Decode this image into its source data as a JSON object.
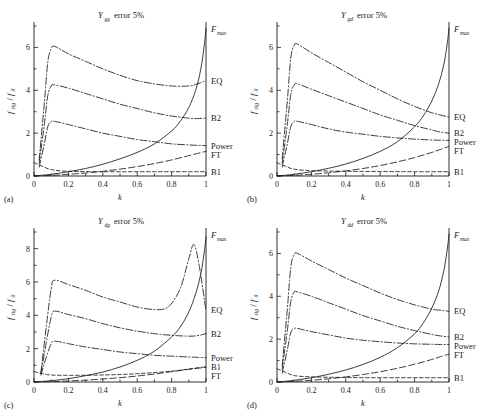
{
  "figure": {
    "panels": [
      {
        "id": "(a)",
        "title_var": "Y",
        "title_sub": "gg",
        "title_rest": "error 5%",
        "xlabel": "k",
        "ylabel_num": "f",
        "ylabel_num_sub": "sig",
        "ylabel_den": "f",
        "ylabel_den_sub": "0",
        "xticks": [
          "0",
          "0.2",
          "0.4",
          "0.6",
          "0.8",
          "1"
        ],
        "yticks": [
          "0",
          "2",
          "4",
          "6"
        ],
        "ylim": [
          0,
          7
        ],
        "xlim": [
          0,
          1
        ],
        "curve_labels": [
          "F",
          "EQ",
          "B2",
          "Power",
          "FT",
          "B1"
        ],
        "fmax_sub": "max"
      },
      {
        "id": "(b)",
        "title_var": "Y",
        "title_sub": "gd",
        "title_rest": "error 5%",
        "xlabel": "k",
        "ylabel_num": "f",
        "ylabel_num_sub": "sig",
        "ylabel_den": "f",
        "ylabel_den_sub": "0",
        "xticks": [
          "0",
          "0.2",
          "0.4",
          "0.6",
          "0.8",
          "1"
        ],
        "yticks": [
          "0",
          "2",
          "4",
          "6"
        ],
        "ylim": [
          0,
          7
        ],
        "xlim": [
          0,
          1
        ],
        "curve_labels": [
          "F",
          "EQ",
          "B2",
          "Power",
          "FT",
          "B1"
        ],
        "fmax_sub": "max"
      },
      {
        "id": "(c)",
        "title_var": "Y",
        "title_sub": "dg",
        "title_rest": "error 5%",
        "xlabel": "k",
        "ylabel_num": "f",
        "ylabel_num_sub": "sig",
        "ylabel_den": "f",
        "ylabel_den_sub": "0",
        "xticks": [
          "0",
          "0.2",
          "0.4",
          "0.6",
          "0.8",
          "1"
        ],
        "yticks": [
          "0",
          "2",
          "4",
          "6",
          "8"
        ],
        "ylim": [
          0,
          9
        ],
        "xlim": [
          0,
          1
        ],
        "curve_labels": [
          "F",
          "EQ",
          "B2",
          "Power",
          "B1",
          "FT"
        ],
        "fmax_sub": "max"
      },
      {
        "id": "(d)",
        "title_var": "Y",
        "title_sub": "dd",
        "title_rest": "error 5%",
        "xlabel": "k",
        "ylabel_num": "f",
        "ylabel_num_sub": "sig",
        "ylabel_den": "f",
        "ylabel_den_sub": "0",
        "xticks": [
          "0",
          "0.2",
          "0.4",
          "0.6",
          "0.8",
          "1"
        ],
        "yticks": [
          "0",
          "2",
          "4",
          "6"
        ],
        "ylim": [
          0,
          7
        ],
        "xlim": [
          0,
          1
        ],
        "curve_labels": [
          "F",
          "EQ",
          "B2",
          "Power",
          "FT",
          "B1"
        ],
        "fmax_sub": "max"
      }
    ]
  },
  "chart_data": [
    {
      "type": "line",
      "panel": "(a)",
      "title": "Y_gg error 5%",
      "xlabel": "k",
      "ylabel": "f_sig/f_0",
      "xlim": [
        0,
        1
      ],
      "ylim": [
        0,
        7
      ],
      "xticks": [
        0,
        0.2,
        0.4,
        0.6,
        0.8,
        1
      ],
      "yticks": [
        0,
        2,
        4,
        6
      ],
      "grid": false,
      "legend_position": "right-outside",
      "series": [
        {
          "name": "EQ",
          "style": "dash-dot",
          "x": [
            0.03,
            0.06,
            0.08,
            0.1,
            0.12,
            0.2,
            0.3,
            0.4,
            0.5,
            0.6,
            0.7,
            0.8,
            0.9,
            0.95,
            1.0
          ],
          "values": [
            0.75,
            3.4,
            5.3,
            5.95,
            6.05,
            5.7,
            5.35,
            5.0,
            4.7,
            4.45,
            4.3,
            4.2,
            4.2,
            4.3,
            4.45
          ]
        },
        {
          "name": "B2",
          "style": "dash-dot",
          "x": [
            0.03,
            0.06,
            0.08,
            0.1,
            0.12,
            0.2,
            0.3,
            0.4,
            0.5,
            0.6,
            0.7,
            0.8,
            0.9,
            0.95,
            1.0
          ],
          "values": [
            0.6,
            2.4,
            3.75,
            4.2,
            4.25,
            4.1,
            3.85,
            3.6,
            3.35,
            3.15,
            2.95,
            2.8,
            2.7,
            2.68,
            2.7
          ]
        },
        {
          "name": "Power",
          "style": "dash-dot",
          "x": [
            0.03,
            0.06,
            0.08,
            0.1,
            0.12,
            0.2,
            0.3,
            0.4,
            0.5,
            0.6,
            0.7,
            0.8,
            0.9,
            0.95,
            1.0
          ],
          "values": [
            0.42,
            1.5,
            2.3,
            2.55,
            2.55,
            2.4,
            2.2,
            2.0,
            1.85,
            1.7,
            1.6,
            1.5,
            1.45,
            1.43,
            1.42
          ]
        },
        {
          "name": "F_max",
          "style": "solid",
          "x": [
            0.0,
            0.1,
            0.2,
            0.3,
            0.4,
            0.5,
            0.6,
            0.7,
            0.8,
            0.85,
            0.9,
            0.94,
            0.97,
            0.99,
            1.0
          ],
          "values": [
            0.0,
            0.08,
            0.2,
            0.35,
            0.55,
            0.8,
            1.1,
            1.5,
            2.1,
            2.55,
            3.2,
            4.0,
            5.0,
            6.1,
            6.9
          ]
        },
        {
          "name": "FT",
          "style": "dashed-lg",
          "x": [
            0.0,
            0.1,
            0.2,
            0.3,
            0.4,
            0.5,
            0.6,
            0.7,
            0.8,
            0.9,
            0.95,
            1.0
          ],
          "values": [
            0.0,
            0.03,
            0.08,
            0.14,
            0.22,
            0.32,
            0.44,
            0.58,
            0.75,
            0.95,
            1.05,
            1.15
          ]
        },
        {
          "name": "B1",
          "style": "dashed",
          "x": [
            0.0,
            0.05,
            0.1,
            0.2,
            0.4,
            0.6,
            0.8,
            1.0
          ],
          "values": [
            0.62,
            0.45,
            0.3,
            0.22,
            0.2,
            0.2,
            0.2,
            0.2
          ]
        }
      ]
    },
    {
      "type": "line",
      "panel": "(b)",
      "title": "Y_gd error 5%",
      "xlabel": "k",
      "ylabel": "f_sig/f_0",
      "xlim": [
        0,
        1
      ],
      "ylim": [
        0,
        7
      ],
      "xticks": [
        0,
        0.2,
        0.4,
        0.6,
        0.8,
        1
      ],
      "yticks": [
        0,
        2,
        4,
        6
      ],
      "grid": false,
      "legend_position": "right-outside",
      "series": [
        {
          "name": "EQ",
          "style": "dash-dot",
          "x": [
            0.03,
            0.06,
            0.08,
            0.1,
            0.12,
            0.2,
            0.3,
            0.4,
            0.5,
            0.6,
            0.7,
            0.8,
            0.9,
            0.95,
            1.0
          ],
          "values": [
            0.8,
            3.5,
            5.5,
            6.1,
            6.15,
            5.75,
            5.3,
            4.85,
            4.4,
            4.0,
            3.6,
            3.25,
            2.95,
            2.85,
            2.75
          ]
        },
        {
          "name": "B2",
          "style": "dash-dot",
          "x": [
            0.03,
            0.06,
            0.08,
            0.1,
            0.12,
            0.2,
            0.3,
            0.4,
            0.5,
            0.6,
            0.7,
            0.8,
            0.9,
            0.95,
            1.0
          ],
          "values": [
            0.6,
            2.4,
            3.8,
            4.25,
            4.3,
            4.05,
            3.75,
            3.45,
            3.15,
            2.85,
            2.6,
            2.35,
            2.15,
            2.05,
            2.0
          ]
        },
        {
          "name": "Power",
          "style": "dash-dot",
          "x": [
            0.03,
            0.06,
            0.08,
            0.1,
            0.12,
            0.2,
            0.3,
            0.4,
            0.5,
            0.6,
            0.7,
            0.8,
            0.9,
            0.95,
            1.0
          ],
          "values": [
            0.42,
            1.5,
            2.3,
            2.55,
            2.55,
            2.4,
            2.2,
            2.05,
            1.95,
            1.85,
            1.78,
            1.72,
            1.68,
            1.67,
            1.66
          ]
        },
        {
          "name": "F_max",
          "style": "solid",
          "x": [
            0.0,
            0.1,
            0.2,
            0.3,
            0.4,
            0.5,
            0.6,
            0.7,
            0.8,
            0.85,
            0.9,
            0.94,
            0.97,
            0.99,
            1.0
          ],
          "values": [
            0.0,
            0.08,
            0.2,
            0.36,
            0.56,
            0.82,
            1.15,
            1.6,
            2.3,
            2.8,
            3.5,
            4.3,
            5.2,
            6.2,
            6.9
          ]
        },
        {
          "name": "FT",
          "style": "dashed-lg",
          "x": [
            0.0,
            0.1,
            0.2,
            0.3,
            0.4,
            0.5,
            0.6,
            0.7,
            0.8,
            0.9,
            0.95,
            1.0
          ],
          "values": [
            0.0,
            0.03,
            0.08,
            0.15,
            0.24,
            0.35,
            0.49,
            0.66,
            0.86,
            1.1,
            1.24,
            1.38
          ]
        },
        {
          "name": "B1",
          "style": "dashed",
          "x": [
            0.0,
            0.05,
            0.1,
            0.2,
            0.4,
            0.6,
            0.8,
            1.0
          ],
          "values": [
            0.62,
            0.45,
            0.32,
            0.25,
            0.22,
            0.21,
            0.2,
            0.2
          ]
        }
      ]
    },
    {
      "type": "line",
      "panel": "(c)",
      "title": "Y_dg error 5%",
      "xlabel": "k",
      "ylabel": "f_sig/f_0",
      "xlim": [
        0,
        1
      ],
      "ylim": [
        0,
        9
      ],
      "xticks": [
        0,
        0.2,
        0.4,
        0.6,
        0.8,
        1
      ],
      "yticks": [
        0,
        2,
        4,
        6,
        8
      ],
      "grid": false,
      "legend_position": "right-outside",
      "series": [
        {
          "name": "EQ",
          "style": "dash-dot",
          "x": [
            0.04,
            0.07,
            0.1,
            0.12,
            0.2,
            0.3,
            0.4,
            0.5,
            0.6,
            0.7,
            0.78,
            0.85,
            0.9,
            0.93,
            0.96,
            1.0
          ],
          "values": [
            0.55,
            3.2,
            5.6,
            6.1,
            5.85,
            5.5,
            5.1,
            4.8,
            4.5,
            4.35,
            4.5,
            5.6,
            7.4,
            8.25,
            7.0,
            4.3
          ]
        },
        {
          "name": "B2",
          "style": "dash-dot",
          "x": [
            0.04,
            0.07,
            0.1,
            0.12,
            0.2,
            0.3,
            0.4,
            0.5,
            0.6,
            0.7,
            0.8,
            0.9,
            0.95,
            1.0
          ],
          "values": [
            0.5,
            2.3,
            3.9,
            4.25,
            4.05,
            3.8,
            3.5,
            3.25,
            3.05,
            2.9,
            2.8,
            2.75,
            2.78,
            2.9
          ]
        },
        {
          "name": "Power",
          "style": "dash-dot",
          "x": [
            0.04,
            0.07,
            0.1,
            0.12,
            0.2,
            0.3,
            0.4,
            0.5,
            0.6,
            0.7,
            0.8,
            0.9,
            0.95,
            1.0
          ],
          "values": [
            0.42,
            1.45,
            2.3,
            2.45,
            2.3,
            2.1,
            1.95,
            1.8,
            1.7,
            1.6,
            1.55,
            1.5,
            1.48,
            1.46
          ]
        },
        {
          "name": "F_max",
          "style": "solid",
          "x": [
            0.0,
            0.1,
            0.2,
            0.3,
            0.4,
            0.5,
            0.6,
            0.7,
            0.8,
            0.85,
            0.9,
            0.94,
            0.97,
            0.99,
            1.0
          ],
          "values": [
            0.0,
            0.08,
            0.2,
            0.38,
            0.6,
            0.9,
            1.3,
            1.85,
            2.7,
            3.3,
            4.2,
            5.3,
            6.5,
            7.8,
            8.7
          ]
        },
        {
          "name": "B1",
          "style": "dashed",
          "x": [
            0.0,
            0.05,
            0.1,
            0.2,
            0.4,
            0.6,
            0.8,
            0.9,
            1.0
          ],
          "values": [
            0.62,
            0.5,
            0.42,
            0.4,
            0.42,
            0.5,
            0.65,
            0.78,
            0.92
          ]
        },
        {
          "name": "FT",
          "style": "dashed-lg",
          "x": [
            0.0,
            0.1,
            0.2,
            0.3,
            0.4,
            0.5,
            0.6,
            0.7,
            0.8,
            0.9,
            0.95,
            1.0
          ],
          "values": [
            0.0,
            0.02,
            0.06,
            0.11,
            0.18,
            0.26,
            0.36,
            0.48,
            0.62,
            0.76,
            0.82,
            0.88
          ]
        }
      ]
    },
    {
      "type": "line",
      "panel": "(d)",
      "title": "Y_dd error 5%",
      "xlabel": "k",
      "ylabel": "f_sig/f_0",
      "xlim": [
        0,
        1
      ],
      "ylim": [
        0,
        7
      ],
      "xticks": [
        0,
        0.2,
        0.4,
        0.6,
        0.8,
        1
      ],
      "yticks": [
        0,
        2,
        4,
        6
      ],
      "grid": false,
      "legend_position": "right-outside",
      "series": [
        {
          "name": "EQ",
          "style": "dash-dot",
          "x": [
            0.03,
            0.06,
            0.08,
            0.1,
            0.12,
            0.2,
            0.3,
            0.4,
            0.5,
            0.6,
            0.7,
            0.8,
            0.9,
            0.95,
            1.0
          ],
          "values": [
            0.75,
            3.4,
            5.35,
            5.95,
            6.0,
            5.65,
            5.25,
            4.85,
            4.5,
            4.15,
            3.85,
            3.6,
            3.4,
            3.35,
            3.3
          ]
        },
        {
          "name": "B2",
          "style": "dash-dot",
          "x": [
            0.03,
            0.06,
            0.08,
            0.1,
            0.12,
            0.2,
            0.3,
            0.4,
            0.5,
            0.6,
            0.7,
            0.8,
            0.9,
            0.95,
            1.0
          ],
          "values": [
            0.6,
            2.4,
            3.75,
            4.2,
            4.2,
            4.0,
            3.7,
            3.4,
            3.1,
            2.85,
            2.6,
            2.4,
            2.22,
            2.15,
            2.1
          ]
        },
        {
          "name": "Power",
          "style": "dash-dot",
          "x": [
            0.03,
            0.06,
            0.08,
            0.1,
            0.12,
            0.2,
            0.3,
            0.4,
            0.5,
            0.6,
            0.7,
            0.8,
            0.9,
            0.95,
            1.0
          ],
          "values": [
            0.42,
            1.5,
            2.3,
            2.5,
            2.5,
            2.35,
            2.2,
            2.05,
            1.95,
            1.88,
            1.82,
            1.78,
            1.76,
            1.75,
            1.75
          ]
        },
        {
          "name": "F_max",
          "style": "solid",
          "x": [
            0.0,
            0.1,
            0.2,
            0.3,
            0.4,
            0.5,
            0.6,
            0.7,
            0.8,
            0.85,
            0.9,
            0.94,
            0.97,
            0.99,
            1.0
          ],
          "values": [
            0.0,
            0.08,
            0.2,
            0.36,
            0.56,
            0.82,
            1.15,
            1.6,
            2.25,
            2.75,
            3.45,
            4.25,
            5.2,
            6.2,
            6.9
          ]
        },
        {
          "name": "FT",
          "style": "dashed-lg",
          "x": [
            0.0,
            0.1,
            0.2,
            0.3,
            0.4,
            0.5,
            0.6,
            0.7,
            0.8,
            0.9,
            0.95,
            1.0
          ],
          "values": [
            0.0,
            0.03,
            0.08,
            0.15,
            0.24,
            0.35,
            0.48,
            0.64,
            0.83,
            1.05,
            1.18,
            1.3
          ]
        },
        {
          "name": "B1",
          "style": "dashed",
          "x": [
            0.0,
            0.05,
            0.1,
            0.2,
            0.4,
            0.6,
            0.8,
            1.0
          ],
          "values": [
            0.62,
            0.45,
            0.3,
            0.24,
            0.21,
            0.2,
            0.2,
            0.2
          ]
        }
      ]
    }
  ]
}
